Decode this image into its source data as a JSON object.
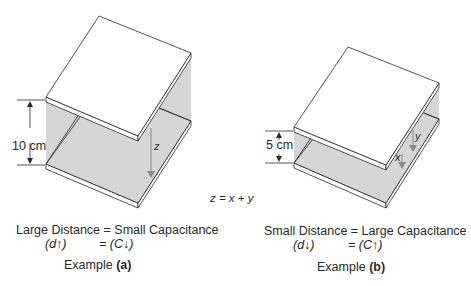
{
  "example_a": {
    "dimension_label": "10 cm",
    "arrow_label": "z",
    "caption_line1": "Large Distance = Small Capacitance",
    "caption_d": "(d↑)",
    "caption_c": "= (C↓)",
    "example_word": "Example",
    "example_id": "(a)"
  },
  "example_b": {
    "dimension_label": "5 cm",
    "arrow_label_x": "x",
    "arrow_label_y": "y",
    "caption_line1": "Small Distance = Large Capacitance",
    "caption_d": "(d↓)",
    "caption_c": "= (C↑)",
    "example_word": "Example",
    "example_id": "(b)"
  },
  "equation": "z = x + y",
  "colors": {
    "plate_face": "#ffffff",
    "field_fill": "#d6d6d6",
    "line": "#2a2a2a",
    "arrow": "#8a8a8a"
  }
}
